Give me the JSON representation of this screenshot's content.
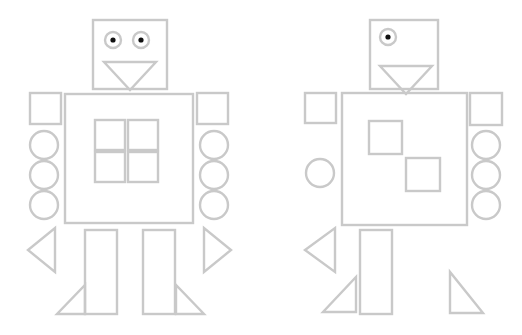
{
  "scene": {
    "title": "Two shape robots line drawing",
    "canvas": {
      "width": 522,
      "height": 335,
      "background": "#ffffff"
    },
    "stroke_color": "#c9c9c9",
    "stroke_width": 2.4,
    "pupil_color": "#111111"
  },
  "robots": [
    {
      "id": "robot-left",
      "label": "Left robot",
      "head": {
        "box": {
          "x": 93,
          "y": 20,
          "w": 74,
          "h": 69
        },
        "eyes": [
          {
            "cx": 113,
            "cy": 40,
            "r": 8,
            "pupil_r": 2.6
          },
          {
            "cx": 141,
            "cy": 40,
            "r": 8,
            "pupil_r": 2.6
          }
        ],
        "mouth_triangle": {
          "points": "104,62 156,62 130,90"
        }
      },
      "body": {
        "x": 65,
        "y": 94,
        "w": 128,
        "h": 129
      },
      "body_squares": [
        {
          "x": 95,
          "y": 120,
          "w": 30,
          "h": 30
        },
        {
          "x": 128,
          "y": 120,
          "w": 30,
          "h": 30
        },
        {
          "x": 95,
          "y": 152,
          "w": 30,
          "h": 30
        },
        {
          "x": 128,
          "y": 152,
          "w": 30,
          "h": 30
        }
      ],
      "left_arm": {
        "shoulder_square": {
          "x": 30,
          "y": 93,
          "w": 31,
          "h": 31
        },
        "circles": [
          {
            "cx": 44,
            "cy": 145,
            "r": 14
          },
          {
            "cx": 44,
            "cy": 175,
            "r": 14
          },
          {
            "cx": 44,
            "cy": 205,
            "r": 14
          }
        ],
        "hand_triangle": {
          "points": "55,228 55,272 28,250"
        }
      },
      "right_arm": {
        "shoulder_square": {
          "x": 197,
          "y": 93,
          "w": 31,
          "h": 31
        },
        "circles": [
          {
            "cx": 214,
            "cy": 145,
            "r": 14
          },
          {
            "cx": 214,
            "cy": 175,
            "r": 14
          },
          {
            "cx": 214,
            "cy": 205,
            "r": 14
          }
        ],
        "hand_triangle": {
          "points": "204,228 204,272 231,250"
        }
      },
      "legs": [
        {
          "x": 85,
          "y": 230,
          "w": 32,
          "h": 84
        },
        {
          "x": 143,
          "y": 230,
          "w": 32,
          "h": 84
        }
      ],
      "feet": [
        {
          "points": "85,285 85,314 57,314"
        },
        {
          "points": "176,285 176,314 204,314"
        }
      ]
    },
    {
      "id": "robot-right",
      "label": "Right robot",
      "head": {
        "box": {
          "x": 370,
          "y": 20,
          "w": 68,
          "h": 69
        },
        "eyes": [
          {
            "cx": 388,
            "cy": 37,
            "r": 8,
            "pupil_r": 2.6
          }
        ],
        "mouth_triangle": {
          "points": "380,66 432,66 406,94"
        }
      },
      "body": {
        "x": 342,
        "y": 93,
        "w": 125,
        "h": 132
      },
      "body_squares": [
        {
          "x": 369,
          "y": 121,
          "w": 33,
          "h": 33
        },
        {
          "x": 406,
          "y": 158,
          "w": 34,
          "h": 33
        }
      ],
      "left_arm": {
        "shoulder_square": {
          "x": 305,
          "y": 93,
          "w": 31,
          "h": 30
        },
        "circles": [
          {
            "cx": 320,
            "cy": 173,
            "r": 14
          }
        ],
        "hand_triangle": {
          "points": "335,228 335,272 305,250"
        }
      },
      "right_arm": {
        "shoulder_square": {
          "x": 470,
          "y": 93,
          "w": 32,
          "h": 32
        },
        "circles": [
          {
            "cx": 486,
            "cy": 145,
            "r": 14
          },
          {
            "cx": 486,
            "cy": 175,
            "r": 14
          },
          {
            "cx": 486,
            "cy": 205,
            "r": 14
          }
        ]
      },
      "legs": [
        {
          "x": 360,
          "y": 230,
          "w": 32,
          "h": 84
        }
      ],
      "feet": [
        {
          "points": "356,277 356,312 323,312"
        },
        {
          "points": "450,272 450,313 483,313"
        }
      ]
    }
  ]
}
